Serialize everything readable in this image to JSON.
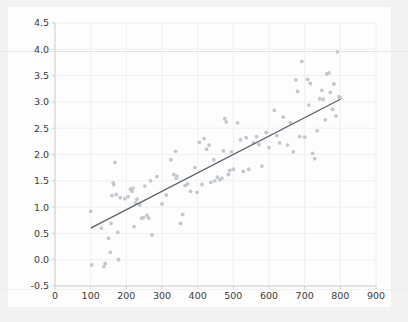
{
  "figure": {
    "background_color": "#fdfdfd",
    "surround_color": "#f2f2f2",
    "point_color": "#c3c8cf",
    "line_color": "#5a6068",
    "grid_color": "#f0f0f2",
    "axis_color": "#cfcfcf",
    "tick_text_color": "#3b3b3b"
  },
  "chart_data": {
    "type": "scatter",
    "title": "",
    "xlabel": "",
    "ylabel": "",
    "xlim": [
      0,
      900
    ],
    "ylim": [
      -0.5,
      4.5
    ],
    "grid": true,
    "legend": null,
    "xticks": [
      0,
      100,
      200,
      300,
      400,
      500,
      600,
      700,
      800,
      900
    ],
    "xtick_labels": [
      "0",
      "100",
      "200",
      "300",
      "400",
      "500",
      "600",
      "700",
      "800",
      "900"
    ],
    "yticks": [
      -0.5,
      0.0,
      0.5,
      1.0,
      1.5,
      2.0,
      2.5,
      3.0,
      3.5,
      4.0,
      4.5
    ],
    "ytick_labels": [
      "-0.5",
      "0.0",
      "0.5",
      "1.0",
      "1.5",
      "2.0",
      "2.5",
      "3.0",
      "3.5",
      "4.0",
      "4.5"
    ],
    "series": [
      {
        "name": "observations",
        "type": "scatter",
        "marker": "circle",
        "color": "#c3c8cf",
        "points": [
          [
            100,
            0.92
          ],
          [
            103,
            -0.1
          ],
          [
            130,
            0.6
          ],
          [
            137,
            -0.13
          ],
          [
            141,
            -0.07
          ],
          [
            150,
            0.41
          ],
          [
            155,
            0.14
          ],
          [
            157,
            0.69
          ],
          [
            160,
            1.22
          ],
          [
            163,
            1.46
          ],
          [
            165,
            1.43
          ],
          [
            168,
            1.85
          ],
          [
            172,
            1.24
          ],
          [
            176,
            0.52
          ],
          [
            178,
            0.0
          ],
          [
            183,
            1.18
          ],
          [
            196,
            1.16
          ],
          [
            205,
            1.2
          ],
          [
            212,
            1.34
          ],
          [
            216,
            1.3
          ],
          [
            218,
            1.36
          ],
          [
            222,
            0.63
          ],
          [
            226,
            1.08
          ],
          [
            230,
            1.15
          ],
          [
            238,
            1.04
          ],
          [
            243,
            0.79
          ],
          [
            248,
            0.8
          ],
          [
            252,
            1.4
          ],
          [
            258,
            0.84
          ],
          [
            263,
            0.79
          ],
          [
            268,
            1.5
          ],
          [
            272,
            0.47
          ],
          [
            286,
            1.58
          ],
          [
            300,
            1.06
          ],
          [
            312,
            1.23
          ],
          [
            325,
            1.9
          ],
          [
            333,
            1.62
          ],
          [
            338,
            2.06
          ],
          [
            340,
            1.55
          ],
          [
            342,
            1.59
          ],
          [
            352,
            0.69
          ],
          [
            358,
            0.86
          ],
          [
            365,
            1.41
          ],
          [
            372,
            1.44
          ],
          [
            380,
            1.3
          ],
          [
            392,
            1.75
          ],
          [
            398,
            1.28
          ],
          [
            405,
            2.23
          ],
          [
            412,
            1.43
          ],
          [
            418,
            2.3
          ],
          [
            425,
            2.1
          ],
          [
            432,
            2.18
          ],
          [
            437,
            1.47
          ],
          [
            445,
            1.9
          ],
          [
            448,
            1.5
          ],
          [
            455,
            1.57
          ],
          [
            462,
            1.52
          ],
          [
            468,
            1.55
          ],
          [
            472,
            2.07
          ],
          [
            476,
            2.68
          ],
          [
            480,
            2.62
          ],
          [
            486,
            1.62
          ],
          [
            490,
            1.7
          ],
          [
            495,
            2.05
          ],
          [
            500,
            1.72
          ],
          [
            512,
            2.6
          ],
          [
            520,
            2.28
          ],
          [
            528,
            1.68
          ],
          [
            536,
            2.32
          ],
          [
            543,
            1.72
          ],
          [
            556,
            2.22
          ],
          [
            565,
            2.34
          ],
          [
            572,
            2.19
          ],
          [
            580,
            1.78
          ],
          [
            592,
            2.42
          ],
          [
            600,
            2.13
          ],
          [
            615,
            2.84
          ],
          [
            622,
            2.36
          ],
          [
            630,
            2.22
          ],
          [
            640,
            2.71
          ],
          [
            652,
            2.18
          ],
          [
            660,
            2.6
          ],
          [
            668,
            2.05
          ],
          [
            675,
            3.42
          ],
          [
            680,
            3.2
          ],
          [
            686,
            2.34
          ],
          [
            692,
            3.77
          ],
          [
            700,
            2.33
          ],
          [
            708,
            3.43
          ],
          [
            712,
            2.94
          ],
          [
            716,
            3.35
          ],
          [
            722,
            2.02
          ],
          [
            728,
            1.92
          ],
          [
            735,
            2.45
          ],
          [
            742,
            3.06
          ],
          [
            748,
            3.22
          ],
          [
            752,
            3.05
          ],
          [
            758,
            2.66
          ],
          [
            762,
            3.53
          ],
          [
            768,
            3.55
          ],
          [
            772,
            3.18
          ],
          [
            778,
            2.86
          ],
          [
            782,
            3.34
          ],
          [
            788,
            2.73
          ],
          [
            792,
            3.95
          ],
          [
            796,
            3.1
          ],
          [
            800,
            3.08
          ]
        ]
      },
      {
        "name": "fit-line",
        "type": "line",
        "color": "#5a6068",
        "x_start": 100,
        "y_start": 0.6,
        "x_end": 800,
        "y_end": 3.05
      }
    ]
  }
}
